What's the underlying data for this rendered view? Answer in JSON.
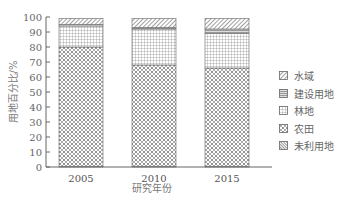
{
  "chart_data": {
    "type": "bar",
    "stacked": true,
    "title": "",
    "xlabel": "研究年份",
    "ylabel": "用地百分比/%",
    "ylim": [
      0,
      100
    ],
    "yticks": [
      0,
      10,
      20,
      30,
      40,
      50,
      60,
      70,
      80,
      90,
      100
    ],
    "categories": [
      "2005",
      "2010",
      "2015"
    ],
    "series": [
      {
        "name": "未利用地",
        "values": [
          0.5,
          0.5,
          0.5
        ],
        "pattern": "dense-diagonal"
      },
      {
        "name": "农田",
        "values": [
          79.5,
          67.5,
          65.5
        ],
        "pattern": "crosshatch-diamond"
      },
      {
        "name": "林地",
        "values": [
          14,
          24,
          23
        ],
        "pattern": "grid"
      },
      {
        "name": "建设用地",
        "values": [
          1,
          1,
          3
        ],
        "pattern": "horizontal-lines"
      },
      {
        "name": "水域",
        "values": [
          4,
          6,
          7
        ],
        "pattern": "diagonal-hatch"
      }
    ],
    "legend_order": [
      "水域",
      "建设用地",
      "林地",
      "农田",
      "未利用地"
    ],
    "legend_position": "right",
    "grid": false
  },
  "legend": {
    "items": [
      {
        "label": "水域",
        "pattern": "diagonal-hatch"
      },
      {
        "label": "建设用地",
        "pattern": "horizontal-lines"
      },
      {
        "label": "林地",
        "pattern": "grid"
      },
      {
        "label": "农田",
        "pattern": "crosshatch-diamond"
      },
      {
        "label": "未利用地",
        "pattern": "dense-diagonal"
      }
    ]
  }
}
